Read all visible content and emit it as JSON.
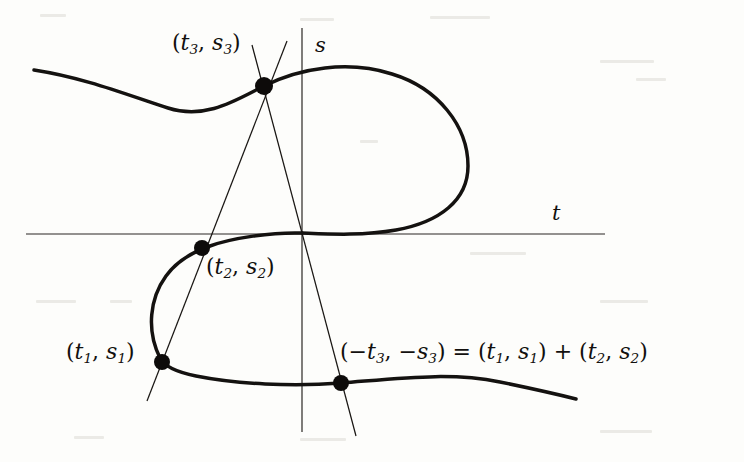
{
  "figure": {
    "kind": "elliptic-curve-group-law-diagram",
    "background_color": "#fdfdfb",
    "ink_color": "#12100e",
    "axes": {
      "horizontal_label": "t",
      "vertical_label": "s",
      "horizontal_label_pos": [
        557,
        213
      ],
      "vertical_label_pos": [
        317,
        46
      ],
      "horizontal_line": [
        26,
        234,
        605,
        234
      ],
      "vertical_line": [
        302,
        28,
        302,
        432
      ],
      "axis_stroke_width": 1.1
    },
    "points": [
      {
        "name": "P1",
        "label": "(t₁, s₁)",
        "t_sub": "1",
        "s_sub": "1",
        "x": 162,
        "y": 362,
        "label_x": 68,
        "label_y": 338,
        "dot_r": 7.5
      },
      {
        "name": "P2",
        "label": "(t₂, s₂)",
        "t_sub": "2",
        "s_sub": "2",
        "x": 202,
        "y": 248,
        "label_x": 205,
        "label_y": 253,
        "dot_r": 7.5
      },
      {
        "name": "P3",
        "label": "(t₃, s₃)",
        "t_sub": "3",
        "s_sub": "3",
        "x": 264,
        "y": 86,
        "label_x": 172,
        "label_y": 30,
        "dot_r": 8.5
      },
      {
        "name": "P4",
        "label": "(-t₃, -s₃) = (t₁, s₁) + (t₂, s₂)",
        "x": 341,
        "y": 383,
        "label_x": 341,
        "label_y": 338,
        "dot_r": 7.5
      }
    ],
    "labels": {
      "p1": {
        "open": "(",
        "t": "t",
        "t_sub": "1",
        "comma": ", ",
        "s": "s",
        "s_sub": "1",
        "close": ")"
      },
      "p2": {
        "open": "(",
        "t": "t",
        "t_sub": "2",
        "comma": ", ",
        "s": "s",
        "s_sub": "2",
        "close": ")"
      },
      "p3": {
        "open": "(",
        "t": "t",
        "t_sub": "3",
        "comma": ", ",
        "s": "s",
        "s_sub": "3",
        "close": ")"
      },
      "sum": {
        "open": "(",
        "neg1": "−",
        "t": "t",
        "t_sub": "3",
        "comma1": ", ",
        "neg2": "−",
        "s": "s",
        "s_sub": "3",
        "close": ")",
        "equals": " = ",
        "open2": "(",
        "t1": "t",
        "t1_sub": "1",
        "comma2": ", ",
        "s1": "s",
        "s1_sub": "1",
        "close2": ")",
        "plus": " + ",
        "open3": "(",
        "t2": "t",
        "t2_sub": "2",
        "comma3": ", ",
        "s2": "s",
        "s2_sub": "2",
        "close3": ")"
      },
      "axis_t": "t",
      "axis_s": "s"
    },
    "curve": {
      "description": "elliptic curve with an oval branch and an unbounded branch",
      "stroke_width": 3.4,
      "oval_path": "M 35 70 C 95 82 150 110 195 122",
      "branch_upper": "M 35 70 C 110 80 170 108 264 86 C 330 70 400 72 440 110 C 478 146 470 200 430 222 C 392 242 340 238 302 234",
      "branch_lower": "M 302 234 C 262 231 222 238 202 248 C 168 265 150 300 162 362 C 176 412 250 405 341 383 C 430 364 510 376 576 398"
    },
    "chords": [
      {
        "name": "line-through-P1-P2-P3",
        "from": [
          147,
          400
        ],
        "to": [
          288,
          42
        ],
        "stroke_width": 1.1
      },
      {
        "name": "line-through-P3-P4-vertical",
        "from": [
          253,
          46
        ],
        "to": [
          355,
          435
        ],
        "stroke_width": 1.1
      }
    ]
  }
}
